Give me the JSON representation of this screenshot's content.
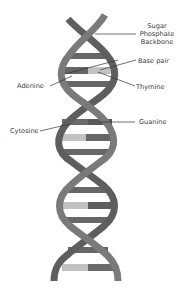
{
  "colors": {
    "background": "#ffffff",
    "strand_a": "#7a7a7a",
    "strand_b": "#5e5e5e",
    "base_dark": "#666666",
    "base_light": "#c2c2c2",
    "leader_line": "#333333",
    "label_text": "#3a3a3a"
  },
  "labels": {
    "backbone": [
      "Sugar",
      "Phosphate",
      "Backbone"
    ],
    "base_pair": "Base pair",
    "adenine": "Adenine",
    "thymine": "Thymine",
    "cytosine": "Cytosine",
    "guanine": "Guanine"
  }
}
